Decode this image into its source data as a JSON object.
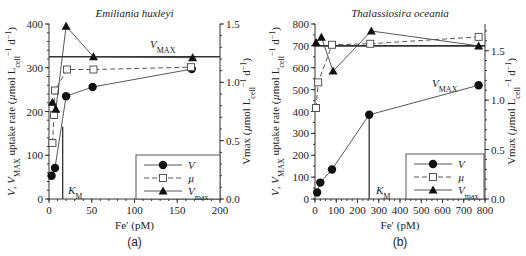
{
  "figure": {
    "panels": [
      {
        "label": "(a)",
        "title": "Emiliania huxleyi"
      },
      {
        "label": "(b)",
        "title": "Thalassiosira oceania"
      }
    ]
  },
  "chart_data": [
    {
      "type": "line",
      "panel": "(a)",
      "title": "Emiliania huxleyi",
      "xlabel": "Fe′ (pM)",
      "ylabel": "V, V_MAX uptake rate (µmol L_cell⁻¹ d⁻¹)",
      "ylabel_right": "Vmax (µmol L_cell⁻¹ d⁻¹)",
      "xlim": [
        0,
        200
      ],
      "ylim": [
        0,
        400
      ],
      "ylim_right": [
        0,
        1.5
      ],
      "xticks": [
        0,
        50,
        100,
        150,
        200
      ],
      "yticks": [
        0,
        100,
        200,
        300,
        400
      ],
      "yticks_right": [
        0.0,
        0.5,
        1.0,
        1.5
      ],
      "series": [
        {
          "name": "V",
          "marker": "filled-circle",
          "line": "solid",
          "axis": "left",
          "x": [
            3,
            7,
            20,
            51,
            167
          ],
          "y": [
            53,
            71,
            235,
            256,
            297
          ]
        },
        {
          "name": "µ",
          "marker": "open-square",
          "line": "dashed",
          "axis": "right",
          "x": [
            4,
            6,
            7,
            21,
            52,
            166
          ],
          "y": [
            0.48,
            0.72,
            0.93,
            1.11,
            1.11,
            1.13
          ]
        },
        {
          "name": "V_max",
          "marker": "filled-triangle",
          "line": "solid",
          "axis": "left",
          "x": [
            4,
            8,
            20,
            52,
            168
          ],
          "y": [
            221,
            205,
            395,
            325,
            323
          ]
        }
      ],
      "annotations": [
        {
          "text": "V_MAX",
          "type": "hline",
          "y": 325
        },
        {
          "text": "K_M",
          "type": "vline",
          "x": 16,
          "y_top": 165
        }
      ],
      "legend": {
        "position": "lower right",
        "entries": [
          "V",
          "µ",
          "V_max"
        ]
      }
    },
    {
      "type": "line",
      "panel": "(b)",
      "title": "Thalassiosira oceania",
      "xlabel": "Fe′ (pM)",
      "ylabel": "V, V_MAX uptake rate (µmol L_cell⁻¹ d⁻¹)",
      "ylabel_right": "Vmax (µmol L_cell⁻¹ d⁻¹)",
      "xlim": [
        0,
        800
      ],
      "ylim": [
        0,
        800
      ],
      "ylim_right": [
        0,
        1.77
      ],
      "xticks": [
        0,
        100,
        200,
        300,
        400,
        500,
        600,
        700,
        800
      ],
      "yticks": [
        0,
        100,
        200,
        300,
        400,
        500,
        600,
        700,
        800
      ],
      "yticks_right": [
        0.0,
        0.5,
        1.0,
        1.5
      ],
      "series": [
        {
          "name": "V",
          "marker": "filled-circle",
          "line": "solid",
          "axis": "left",
          "x": [
            10,
            25,
            80,
            255,
            770
          ],
          "y": [
            30,
            75,
            135,
            385,
            520
          ]
        },
        {
          "name": "µ",
          "marker": "open-square",
          "line": "dashed",
          "axis": "right",
          "x": [
            5,
            15,
            80,
            260,
            770
          ],
          "y": [
            0.92,
            1.18,
            1.56,
            1.57,
            1.64
          ]
        },
        {
          "name": "V_max",
          "marker": "filled-triangle",
          "line": "solid",
          "axis": "left",
          "x": [
            5,
            30,
            85,
            265,
            770
          ],
          "y": [
            715,
            740,
            585,
            768,
            700
          ]
        }
      ],
      "annotations": [
        {
          "text": "V_MAX",
          "type": "hline",
          "y": 700
        },
        {
          "text": "K_M",
          "type": "vline",
          "x": 255,
          "y_top": 385
        }
      ],
      "legend": {
        "position": "lower right",
        "entries": [
          "V",
          "µ",
          "V_max"
        ]
      }
    }
  ]
}
